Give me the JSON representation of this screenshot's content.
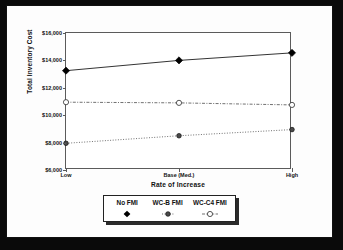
{
  "chart_data": {
    "type": "line",
    "title": "",
    "xlabel": "Rate of Increase",
    "ylabel": "Total Inventory Cost",
    "categories": [
      "Low",
      "Base (Med.)",
      "High"
    ],
    "ylim": [
      6000,
      16000
    ],
    "ytick_labels": [
      "$16,000",
      "$14,000",
      "$12,000",
      "$10,000",
      "$8,000",
      "$6,000"
    ],
    "ytick_values": [
      16000,
      14000,
      12000,
      10000,
      8000,
      6000
    ],
    "grid": false,
    "legend_position": "below",
    "series": [
      {
        "name": "No FMI",
        "values": [
          13250,
          14000,
          14550
        ],
        "marker": "filled-diamond",
        "line_style": "solid",
        "color": "#000000"
      },
      {
        "name": "WC-B FMI",
        "values": [
          7950,
          8500,
          8950
        ],
        "marker": "small-circle",
        "line_style": "dotted",
        "color": "#333333"
      },
      {
        "name": "WC-C4 FMI",
        "values": [
          10950,
          10900,
          10750
        ],
        "marker": "open-circle",
        "line_style": "dash-dot",
        "color": "#333333"
      }
    ]
  },
  "legend": {
    "items": [
      {
        "label": "No FMI",
        "marker_name": "filled-diamond-marker"
      },
      {
        "label": "WC-B FMI",
        "marker_name": "small-circle-marker"
      },
      {
        "label": "WC-C4 FMI",
        "marker_name": "open-circle-marker"
      }
    ]
  }
}
